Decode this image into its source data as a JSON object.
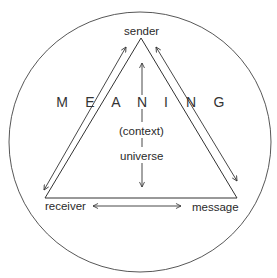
{
  "diagram": {
    "nodes": {
      "sender": "sender",
      "receiver": "receiver",
      "message": "message"
    },
    "center_labels": {
      "context": "(context)",
      "universe": "universe"
    },
    "banner_word": "MEANING",
    "banner_letters": [
      "M",
      "E",
      "A",
      "N",
      "I",
      "N",
      "G"
    ],
    "colors": {
      "stroke": "#333333",
      "text": "#2a2a2a",
      "background": "#ffffff"
    },
    "edges": [
      {
        "from": "sender",
        "to": "receiver",
        "arrow": "bidirectional",
        "note": "parallel arrow along left side"
      },
      {
        "from": "sender",
        "to": "message",
        "arrow": "bidirectional",
        "note": "parallel arrow along right side"
      },
      {
        "from": "receiver",
        "to": "message",
        "arrow": "bidirectional",
        "note": "horizontal arrow along base"
      },
      {
        "from": "universe",
        "to": "sender",
        "arrow": "up",
        "note": "vertical arrow through (context)"
      },
      {
        "from": "universe",
        "to": "base",
        "arrow": "down"
      }
    ]
  }
}
